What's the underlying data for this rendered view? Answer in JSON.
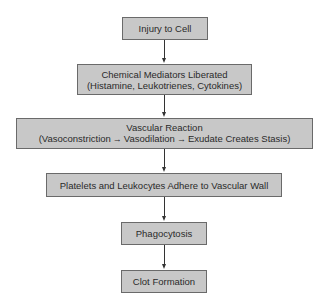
{
  "diagram": {
    "type": "flowchart",
    "direction": "top-to-bottom",
    "colors": {
      "box_fill": "#c8c8c8",
      "box_border": "#6a6a6a",
      "arrow": "#333333",
      "background": "#ffffff"
    },
    "nodes": [
      {
        "id": "injury",
        "lines": [
          "Injury to Cell"
        ]
      },
      {
        "id": "mediators",
        "lines": [
          "Chemical Mediators Liberated",
          "(Histamine, Leukotrienes, Cytokines)"
        ]
      },
      {
        "id": "vascular",
        "title": "Vascular Reaction",
        "sequence": {
          "open": "(",
          "steps": [
            "Vasoconstriction",
            "Vasodilation",
            "Exudate Creates Stasis"
          ],
          "close": ")",
          "arrow": "→"
        }
      },
      {
        "id": "platelets",
        "lines": [
          "Platelets and Leukocytes Adhere to Vascular Wall"
        ]
      },
      {
        "id": "phagocytosis",
        "lines": [
          "Phagocytosis"
        ]
      },
      {
        "id": "clot",
        "lines": [
          "Clot Formation"
        ]
      }
    ],
    "edges": [
      {
        "from": "injury",
        "to": "mediators"
      },
      {
        "from": "mediators",
        "to": "vascular"
      },
      {
        "from": "vascular",
        "to": "platelets"
      },
      {
        "from": "platelets",
        "to": "phagocytosis"
      },
      {
        "from": "phagocytosis",
        "to": "clot"
      }
    ]
  }
}
